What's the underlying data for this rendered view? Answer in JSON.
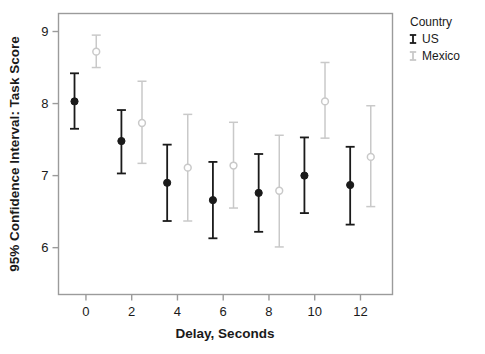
{
  "chart_data": {
    "type": "scatter",
    "title": "",
    "xlabel": "Delay, Seconds",
    "ylabel": "95% Confidence Interval: Task Score",
    "xlim": [
      -1.2,
      13.4
    ],
    "ylim": [
      5.35,
      9.25
    ],
    "xticks": [
      0,
      2,
      4,
      6,
      8,
      10,
      12
    ],
    "xticklabels": [
      "0",
      "2",
      "4",
      "6",
      "8",
      "10",
      "12"
    ],
    "yticks": [
      6,
      7,
      8,
      9
    ],
    "yticklabels": [
      "6",
      "7",
      "8",
      "9"
    ],
    "grid": false,
    "error_bars": "95% confidence interval",
    "legend": {
      "title": "Country",
      "position": "right",
      "entries": [
        {
          "name": "US",
          "color": "#1a1a1a",
          "marker": "filled-circle"
        },
        {
          "name": "Mexico",
          "color": "#c9c9c9",
          "marker": "open-circle"
        }
      ]
    },
    "series": [
      {
        "name": "US",
        "color": "#1a1a1a",
        "marker": "filled-circle",
        "points": [
          {
            "x": -0.5,
            "y": 8.03,
            "lo": 7.65,
            "hi": 8.42
          },
          {
            "x": 1.55,
            "y": 7.48,
            "lo": 7.03,
            "hi": 7.91
          },
          {
            "x": 3.55,
            "y": 6.9,
            "lo": 6.37,
            "hi": 7.43
          },
          {
            "x": 5.55,
            "y": 6.66,
            "lo": 6.13,
            "hi": 7.19
          },
          {
            "x": 7.55,
            "y": 6.76,
            "lo": 6.22,
            "hi": 7.3
          },
          {
            "x": 9.55,
            "y": 7.0,
            "lo": 6.48,
            "hi": 7.53
          },
          {
            "x": 11.55,
            "y": 6.87,
            "lo": 6.32,
            "hi": 7.4
          }
        ]
      },
      {
        "name": "Mexico",
        "color": "#c9c9c9",
        "marker": "open-circle",
        "points": [
          {
            "x": 0.45,
            "y": 8.72,
            "lo": 8.5,
            "hi": 8.95
          },
          {
            "x": 2.45,
            "y": 7.73,
            "lo": 7.17,
            "hi": 8.31
          },
          {
            "x": 4.45,
            "y": 7.11,
            "lo": 6.37,
            "hi": 7.85
          },
          {
            "x": 6.45,
            "y": 7.14,
            "lo": 6.55,
            "hi": 7.74
          },
          {
            "x": 8.45,
            "y": 6.79,
            "lo": 6.01,
            "hi": 7.56
          },
          {
            "x": 10.45,
            "y": 8.03,
            "lo": 7.52,
            "hi": 8.57
          },
          {
            "x": 12.45,
            "y": 7.26,
            "lo": 6.57,
            "hi": 7.97
          }
        ]
      }
    ]
  }
}
